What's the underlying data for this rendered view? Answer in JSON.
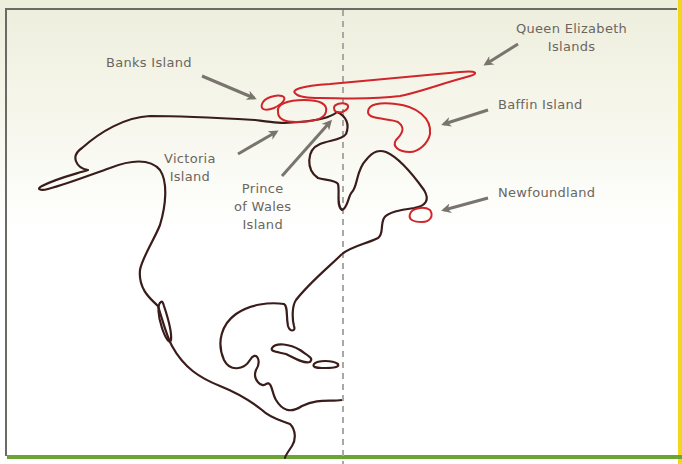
{
  "diagram": {
    "colors": {
      "mainland_outline": "#3a1c1a",
      "island_outline": "#d0252a",
      "arrow": "#7a746e",
      "label_text": "#6b6660",
      "divider": "#a8a8a4",
      "bottom_bar": "#6aa534",
      "right_edge": "#f2d61c"
    },
    "labels": {
      "banks": "Banks Island",
      "victoria_line1": "Victoria",
      "victoria_line2": "Island",
      "prince_line1": "Prince",
      "prince_line2": "of Wales",
      "prince_line3": "Island",
      "queen_line1": "Queen Elizabeth",
      "queen_line2": "Islands",
      "baffin": "Baffin Island",
      "newfoundland": "Newfoundland"
    }
  }
}
